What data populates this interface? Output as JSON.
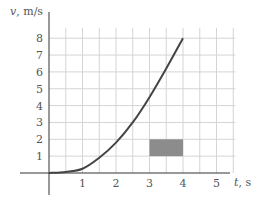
{
  "chart_data": {
    "type": "line",
    "title": "",
    "xlabel": "t, s",
    "ylabel": "v, m/s",
    "xlabel_var": "t",
    "xlabel_unit": ", s",
    "ylabel_var": "v",
    "ylabel_unit": ", m/s",
    "xlim": [
      0,
      5.5
    ],
    "ylim": [
      0,
      8.5
    ],
    "grid": true,
    "grid_x_step": 0.5,
    "grid_y_step": 1,
    "x_ticks": [
      "1",
      "2",
      "3",
      "4",
      "5"
    ],
    "y_ticks": [
      "1",
      "2",
      "3",
      "4",
      "5",
      "6",
      "7",
      "8"
    ],
    "series": [
      {
        "name": "velocity",
        "x": [
          0,
          0.5,
          1,
          1.5,
          2,
          2.5,
          3,
          3.5,
          4
        ],
        "values": [
          0,
          0.06,
          0.25,
          0.9,
          1.8,
          3.0,
          4.5,
          6.2,
          8.0
        ],
        "color": "#444444"
      }
    ],
    "annotations": [
      {
        "type": "shaded-rectangle",
        "x_range": [
          3,
          4
        ],
        "y_range": [
          1,
          2
        ],
        "color": "#8c8c8c"
      }
    ],
    "legend": null
  },
  "colors": {
    "axis": "#333333",
    "grid": "#d4d4d4",
    "curve": "#444444",
    "rect": "#8c8c8c",
    "text": "#555555"
  }
}
